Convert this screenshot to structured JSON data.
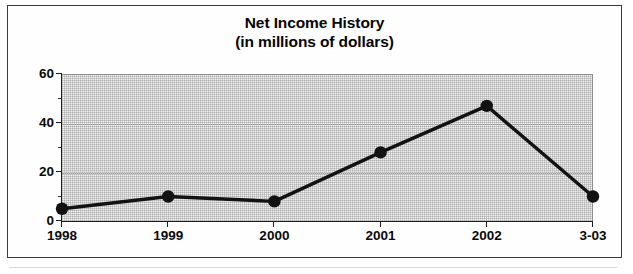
{
  "chart_data": {
    "type": "line",
    "title": "Net Income History",
    "subtitle": "(in millions of dollars)",
    "xlabel": "",
    "ylabel": "",
    "categories": [
      "1998",
      "1999",
      "2000",
      "2001",
      "2002",
      "3-03"
    ],
    "values": [
      5,
      10,
      8,
      28,
      47,
      10
    ],
    "ylim": [
      0,
      60
    ],
    "yticks": [
      "0",
      "20",
      "40",
      "60"
    ],
    "ytick_values": [
      0,
      20,
      40,
      60
    ],
    "yminor_values": [
      10,
      30,
      50
    ],
    "grid": true,
    "legend": false,
    "series": [
      {
        "name": "Net Income",
        "values": [
          5,
          10,
          8,
          28,
          47,
          10
        ]
      }
    ],
    "colors": {
      "line": "#121212",
      "marker": "#121212",
      "plot_background": "#f1f1f1",
      "gridline": "#9b9b9b",
      "axis": "#1d1d1d",
      "frame_border": "#3a3a3a",
      "text": "#0a0a0a"
    }
  }
}
